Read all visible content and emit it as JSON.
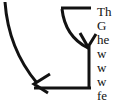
{
  "canvas": {
    "width": 113,
    "height": 107,
    "background_color": "#ffffff",
    "stroke_color": "#121212",
    "text_color": "#121212"
  },
  "diagram": {
    "name": "curved-arrows-pointing-to-text",
    "stroke_width": 3,
    "shapes": [
      {
        "name": "long-curved-arrow",
        "description": "long curve sweeping from top-left corner down and right, ending in a left-pointing arrowhead",
        "start": [
          5,
          2
        ],
        "end": [
          35,
          84
        ],
        "arrowhead": "left"
      },
      {
        "name": "short-curved-arrow",
        "description": "short curve from upper area sweeping right and down, ending in a downward-pointing arrowhead",
        "start": [
          62,
          8
        ],
        "end": [
          88,
          46
        ],
        "arrowhead": "down"
      },
      {
        "name": "top-horizontal-rule",
        "description": "horizontal line along the top from the short curve origin to the right vertical",
        "from": [
          62,
          8
        ],
        "to": [
          90,
          8
        ]
      },
      {
        "name": "right-vertical-rule",
        "description": "vertical line down the right side from the down arrowhead to the bottom corner",
        "from": [
          89,
          46
        ],
        "to": [
          89,
          89
        ]
      },
      {
        "name": "bottom-horizontal-rule",
        "description": "horizontal line along the bottom from the left arrowhead tip to the bottom-right corner",
        "from": [
          35,
          88
        ],
        "to": [
          90,
          88
        ]
      }
    ]
  },
  "text_block": {
    "name": "clipped-paragraph",
    "description": "serif text lines clipped by the right edge of the screenshot",
    "font_size_px": 13,
    "line_height_px": 13,
    "lines": [
      {
        "text": "Th",
        "top": 5
      },
      {
        "text": "G",
        "top": 19
      },
      {
        "text": "he",
        "top": 33
      },
      {
        "text": "w",
        "top": 47
      },
      {
        "text": "w",
        "top": 61
      },
      {
        "text": "w",
        "top": 75
      },
      {
        "text": "fe",
        "top": 89
      }
    ]
  }
}
